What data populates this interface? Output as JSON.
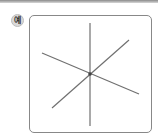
{
  "label": {
    "text": "예"
  },
  "diagram": {
    "intersection_point": [
      90,
      74
    ],
    "line_color": "#707070",
    "lines": [
      {
        "name": "vertical-line",
        "from": [
          90,
          23
        ],
        "to": [
          90,
          126
        ]
      },
      {
        "name": "descending-line",
        "from": [
          42,
          53
        ],
        "to": [
          139,
          94
        ]
      },
      {
        "name": "ascending-line",
        "from": [
          52,
          108
        ],
        "to": [
          129,
          40
        ]
      }
    ]
  }
}
